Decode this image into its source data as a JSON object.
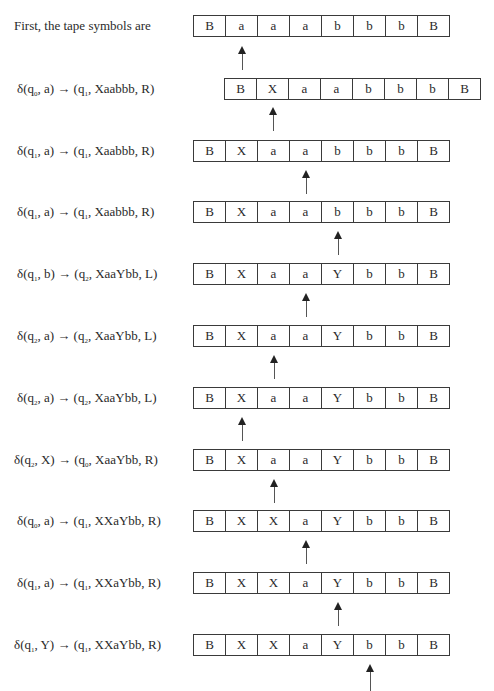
{
  "intro_label": "First, the tape symbols are",
  "rows": [
    {
      "label": {
        "pre": "",
        "state": "",
        "sym": "",
        "next": "",
        "tape_str": "",
        "dir": "",
        "text": "First, the tape symbols are"
      },
      "tape": [
        "B",
        "a",
        "a",
        "a",
        "b",
        "b",
        "b",
        "B"
      ],
      "tape_left": 193,
      "tape_top": 15,
      "head_index": 1,
      "arrow_top": 46,
      "arrow_h": 24
    },
    {
      "label": {
        "text": "δ(q0, a) → (q1, Xaabbb, R)",
        "s1": "0",
        "a1": "a",
        "s2": "1",
        "w": "Xaabbb",
        "d": "R"
      },
      "tape": [
        "B",
        "X",
        "a",
        "a",
        "b",
        "b",
        "b",
        "B"
      ],
      "tape_left": 224,
      "tape_top": 78,
      "head_index": 1,
      "arrow_top": 107,
      "arrow_h": 24
    },
    {
      "label": {
        "text": "δ(q1, a) → (q1, Xaabbb, R)",
        "s1": "1",
        "a1": "a",
        "s2": "1",
        "w": "Xaabbb",
        "d": "R"
      },
      "tape": [
        "B",
        "X",
        "a",
        "a",
        "b",
        "b",
        "b",
        "B"
      ],
      "tape_left": 193,
      "tape_top": 140,
      "head_index": 3,
      "arrow_top": 170,
      "arrow_h": 24
    },
    {
      "label": {
        "text": "δ(q1, a) → (q1, Xaabbb, R)",
        "s1": "1",
        "a1": "a",
        "s2": "1",
        "w": "Xaabbb",
        "d": "R"
      },
      "tape": [
        "B",
        "X",
        "a",
        "a",
        "b",
        "b",
        "b",
        "B"
      ],
      "tape_left": 193,
      "tape_top": 201,
      "head_index": 4,
      "arrow_top": 231,
      "arrow_h": 24
    },
    {
      "label": {
        "text": "δ(q1, b) → (q2, XaaYbb, L)",
        "s1": "1",
        "a1": "b",
        "s2": "2",
        "w": "XaaYbb",
        "d": "L"
      },
      "tape": [
        "B",
        "X",
        "a",
        "a",
        "Y",
        "b",
        "b",
        "B"
      ],
      "tape_left": 193,
      "tape_top": 263,
      "head_index": 3,
      "arrow_top": 293,
      "arrow_h": 24
    },
    {
      "label": {
        "text": "δ(q2, a) → (q2, XaaYbb, L)",
        "s1": "2",
        "a1": "a",
        "s2": "2",
        "w": "XaaYbb",
        "d": "L"
      },
      "tape": [
        "B",
        "X",
        "a",
        "a",
        "Y",
        "b",
        "b",
        "B"
      ],
      "tape_left": 193,
      "tape_top": 325,
      "head_index": 2,
      "arrow_top": 355,
      "arrow_h": 24
    },
    {
      "label": {
        "text": "δ(q2, a) → (q2, XaaYbb, L)",
        "s1": "2",
        "a1": "a",
        "s2": "2",
        "w": "XaaYbb",
        "d": "L"
      },
      "tape": [
        "B",
        "X",
        "a",
        "a",
        "Y",
        "b",
        "b",
        "B"
      ],
      "tape_left": 193,
      "tape_top": 387,
      "head_index": 1,
      "arrow_top": 417,
      "arrow_h": 24
    },
    {
      "label": {
        "text": "δ(q2, X) → (q0, XaaYbb, R)",
        "s1": "2",
        "a1": "X",
        "s2": "0",
        "w": "XaaYbb",
        "d": "R"
      },
      "tape": [
        "B",
        "X",
        "a",
        "a",
        "Y",
        "b",
        "b",
        "B"
      ],
      "tape_left": 193,
      "tape_top": 449,
      "head_index": 2,
      "arrow_top": 479,
      "arrow_h": 24
    },
    {
      "label": {
        "text": "δ(q0, a) → (q1, XXaYbb, R)",
        "s1": "0",
        "a1": "a",
        "s2": "1",
        "w": "XXaYbb",
        "d": "R"
      },
      "tape": [
        "B",
        "X",
        "X",
        "a",
        "Y",
        "b",
        "b",
        "B"
      ],
      "tape_left": 193,
      "tape_top": 510,
      "head_index": 3,
      "arrow_top": 540,
      "arrow_h": 24
    },
    {
      "label": {
        "text": "δ(q1, a) → (q1, XXaYbb, R)",
        "s1": "1",
        "a1": "a",
        "s2": "1",
        "w": "XXaYbb",
        "d": "R"
      },
      "tape": [
        "B",
        "X",
        "X",
        "a",
        "Y",
        "b",
        "b",
        "B"
      ],
      "tape_left": 193,
      "tape_top": 572,
      "head_index": 4,
      "arrow_top": 602,
      "arrow_h": 24
    },
    {
      "label": {
        "text": "δ(q1, Y) → (q1, XXaYbb, R)",
        "s1": "1",
        "a1": "Y",
        "s2": "1",
        "w": "XXaYbb",
        "d": "R"
      },
      "tape": [
        "B",
        "X",
        "X",
        "a",
        "Y",
        "b",
        "b",
        "B"
      ],
      "tape_left": 193,
      "tape_top": 634,
      "head_index": 5,
      "arrow_top": 664,
      "arrow_h": 27
    }
  ],
  "label_tops": [
    18,
    81,
    143,
    204,
    266,
    328,
    390,
    452,
    513,
    575,
    637
  ]
}
